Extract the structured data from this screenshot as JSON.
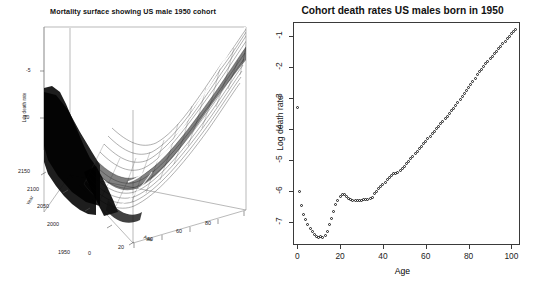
{
  "figure": {
    "background": "#ffffff",
    "point_color": "#1a1a1a",
    "axis_color": "#3a3a3a"
  },
  "left_panel": {
    "title": "Mortality surface showing US male 1950 cohort",
    "z_axis": {
      "label": "Log death rate",
      "ticks": [
        "-5",
        "-10"
      ]
    },
    "year_axis": {
      "label": "Year",
      "ticks": [
        "1950",
        "2000",
        "2050",
        "2100",
        "2150"
      ]
    },
    "age_axis": {
      "label": "Age",
      "ticks": [
        "0",
        "20",
        "40",
        "60",
        "80"
      ]
    },
    "surface_note": "wireframe perspective mesh with white highlighted 1950 cohort line"
  },
  "right_panel": {
    "title": "Cohort death rates US males born in 1950",
    "x_axis": {
      "label": "Age",
      "ticks": [
        "0",
        "20",
        "40",
        "60",
        "80",
        "100"
      ]
    },
    "y_axis": {
      "label": "Log death rate",
      "ticks": [
        "-1",
        "-2",
        "-3",
        "-4",
        "-5",
        "-6",
        "-7"
      ]
    }
  },
  "chart_data": [
    {
      "type": "scatter",
      "title": "Cohort death rates US males born in 1950",
      "xlabel": "Age",
      "ylabel": "Log death rate",
      "xlim": [
        -2,
        104
      ],
      "ylim": [
        -7.75,
        -0.55
      ],
      "grid": false,
      "legend": null,
      "marker": "open-circle",
      "x": [
        0,
        1,
        2,
        3,
        4,
        5,
        6,
        7,
        8,
        9,
        10,
        11,
        12,
        13,
        14,
        15,
        16,
        17,
        18,
        19,
        20,
        21,
        22,
        23,
        24,
        25,
        26,
        27,
        28,
        29,
        30,
        31,
        32,
        33,
        34,
        35,
        36,
        37,
        38,
        39,
        40,
        41,
        42,
        43,
        44,
        45,
        46,
        47,
        48,
        49,
        50,
        51,
        52,
        53,
        54,
        55,
        56,
        57,
        58,
        59,
        60,
        61,
        62,
        63,
        64,
        65,
        66,
        67,
        68,
        69,
        70,
        71,
        72,
        73,
        74,
        75,
        76,
        77,
        78,
        79,
        80,
        81,
        82,
        83,
        84,
        85,
        86,
        87,
        88,
        89,
        90,
        91,
        92,
        93,
        94,
        95,
        96,
        97,
        98,
        99,
        100,
        101,
        102
      ],
      "y": [
        -3.3,
        -6.01,
        -6.47,
        -6.76,
        -6.93,
        -7.1,
        -7.23,
        -7.33,
        -7.42,
        -7.47,
        -7.5,
        -7.49,
        -7.51,
        -7.45,
        -7.31,
        -7.1,
        -6.88,
        -6.66,
        -6.45,
        -6.3,
        -6.17,
        -6.12,
        -6.13,
        -6.18,
        -6.24,
        -6.28,
        -6.3,
        -6.31,
        -6.32,
        -6.31,
        -6.3,
        -6.29,
        -6.28,
        -6.28,
        -6.26,
        -6.22,
        -6.1,
        -6.01,
        -5.93,
        -5.86,
        -5.79,
        -5.72,
        -5.65,
        -5.58,
        -5.51,
        -5.45,
        -5.44,
        -5.42,
        -5.36,
        -5.28,
        -5.2,
        -5.12,
        -5.04,
        -4.96,
        -4.88,
        -4.8,
        -4.72,
        -4.64,
        -4.56,
        -4.48,
        -4.4,
        -4.32,
        -4.24,
        -4.16,
        -4.08,
        -4.0,
        -3.92,
        -3.84,
        -3.76,
        -3.68,
        -3.6,
        -3.51,
        -3.42,
        -3.33,
        -3.24,
        -3.15,
        -3.06,
        -2.96,
        -2.86,
        -2.76,
        -2.66,
        -2.56,
        -2.46,
        -2.36,
        -2.26,
        -2.16,
        -2.07,
        -1.98,
        -1.89,
        -1.81,
        -1.73,
        -1.65,
        -1.57,
        -1.49,
        -1.41,
        -1.33,
        -1.25,
        -1.17,
        -1.09,
        -1.01,
        -0.93,
        -0.85,
        -0.78
      ]
    },
    {
      "type": "surface",
      "title": "Mortality surface showing US male 1950 cohort",
      "xlabel": "Age",
      "ylabel": "Year",
      "zlabel": "Log death rate",
      "xlim": [
        0,
        90
      ],
      "ylim": [
        1950,
        2150
      ],
      "zlim": [
        -12,
        -2
      ],
      "highlight": "US male 1950 cohort"
    }
  ]
}
